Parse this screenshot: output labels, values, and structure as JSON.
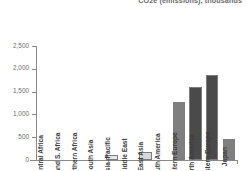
{
  "chart_data": {
    "type": "bar",
    "title": "CO2e (emissions), thousands",
    "xlabel": "",
    "ylabel": "",
    "ylim": [
      0,
      2500
    ],
    "yticks": [
      0,
      500,
      1000,
      1500,
      2000,
      2500
    ],
    "ytick_labels": [
      "0",
      "500",
      "1,000",
      "1,500",
      "2,000",
      "2,500"
    ],
    "grid": false,
    "legend": null,
    "categories": [
      "Central Africa",
      "E. and S. Africa",
      "Northern Africa",
      "South Asia",
      "Asia–Pacific",
      "Middle East",
      "East Asia",
      "South America",
      "Eastern Europe",
      "North America",
      "Western Europe",
      "Japan"
    ],
    "values": [
      0,
      0,
      0,
      0,
      100,
      0,
      165,
      0,
      1270,
      1600,
      1870,
      460
    ],
    "bar_colors": [
      "#f2f2f2",
      "#f2f2f2",
      "#f2f2f2",
      "#f2f2f2",
      "#e8e8e8",
      "#f2f2f2",
      "#d8d8d8",
      "#f2f2f2",
      "#7f7f7f",
      "#4a4a4a",
      "#4a4a4a",
      "#808080"
    ]
  },
  "colors": {
    "axis": "#8a8a8a",
    "text": "#6b6b6b",
    "label": "#3d3d3d",
    "background": "#ffffff"
  }
}
